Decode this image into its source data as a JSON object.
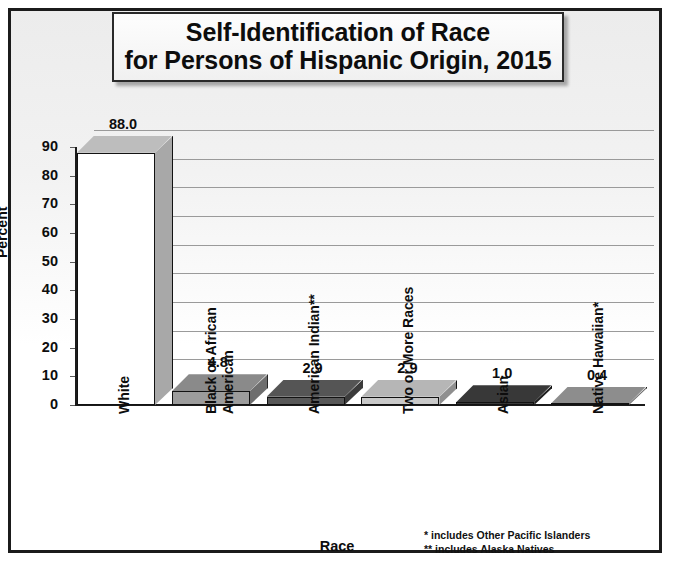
{
  "chart_data": {
    "type": "bar",
    "title": "Self-Identification of Race for Persons of Hispanic Origin, 2015",
    "title_lines": [
      "Self-Identification of Race",
      "for Persons of Hispanic Origin, 2015"
    ],
    "xlabel": "Race",
    "ylabel": "Percent",
    "categories": [
      "White",
      "Black or African American",
      "American Indian**",
      "Two or More Races",
      "Asian",
      "Native Hawaiian*"
    ],
    "category_lines": [
      [
        "White"
      ],
      [
        "Black or African",
        "American"
      ],
      [
        "American Indian**"
      ],
      [
        "Two or More Races"
      ],
      [
        "Asian"
      ],
      [
        "Native Hawaiian*"
      ]
    ],
    "values": [
      88.0,
      4.8,
      2.9,
      2.9,
      1.0,
      0.4
    ],
    "value_labels": [
      "88.0",
      "4.8",
      "2.9",
      "2.9",
      "1.0",
      "0.4"
    ],
    "ylim": [
      0,
      90
    ],
    "yticks": [
      0,
      10,
      20,
      30,
      40,
      50,
      60,
      70,
      80,
      90
    ],
    "ytick_labels": [
      "0",
      "10",
      "20",
      "30",
      "40",
      "50",
      "60",
      "70",
      "80",
      "90"
    ],
    "grid": true,
    "legend": "none",
    "bar_colors": [
      "#ffffff",
      "#9c9c9c",
      "#585858",
      "#c9c9c9",
      "#3a3a3a",
      "#9a9a9a"
    ],
    "bar_side_colors": [
      "#a8a8a8",
      "#6e6e6e",
      "#3b3b3b",
      "#8f8f8f",
      "#1e1e1e",
      "#6d6d6d"
    ],
    "bar_top_colors": [
      "#bdbdbd",
      "#8a8a8a",
      "#555555",
      "#b6b6b6",
      "#383838",
      "#8d8d8d"
    ],
    "annotations": [
      "* includes Other Pacific Islanders",
      "** includes Alaska Natives"
    ]
  },
  "footnotes": {
    "line1": "* includes Other Pacific Islanders",
    "line2": "** includes Alaska Natives"
  }
}
